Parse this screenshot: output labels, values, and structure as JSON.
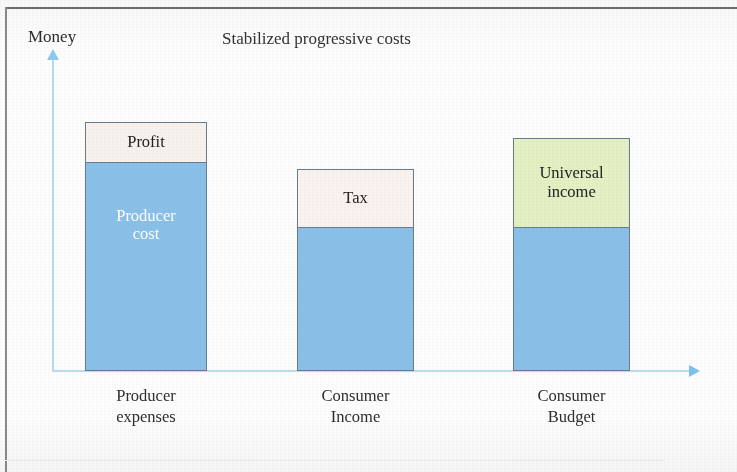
{
  "chart_data": {
    "type": "bar",
    "title": "Stabilized progressive costs",
    "subtitle": "",
    "xlabel": "",
    "ylabel": "Money",
    "stacked": true,
    "grid": false,
    "legend": "none",
    "axis_arrows": true,
    "ylim": [
      0,
      100
    ],
    "categories": [
      "Producer expenses",
      "Consumer Income",
      "Consumer Budget"
    ],
    "series": [
      {
        "name": "Base",
        "values": [
          67,
          46,
          46
        ],
        "labels": [
          "Producer cost",
          "",
          ""
        ],
        "color": "#8ac0e8"
      },
      {
        "name": "Top",
        "values": [
          13,
          19,
          29
        ],
        "labels": [
          "Profit",
          "Tax",
          "Universal income"
        ],
        "colors": [
          "#f7f1ee",
          "#f9f2ef",
          "#e3f0c4"
        ]
      }
    ],
    "bars": [
      {
        "category_line1": "Producer",
        "category_line2": "expenses",
        "top_label": "Profit",
        "top_label_line2": "",
        "base_label_line1": "Producer",
        "base_label_line2": "cost",
        "top_color": "#f7f1ee",
        "base_color": "#8ac0e8",
        "top_text_color": "#222222",
        "base_text_color": "#ffffff",
        "total_height_pct": 80,
        "top_height_pct": 13
      },
      {
        "category_line1": "Consumer",
        "category_line2": "Income",
        "top_label": "Tax",
        "top_label_line2": "",
        "base_label_line1": "",
        "base_label_line2": "",
        "top_color": "#f9f2ef",
        "base_color": "#8ac0e8",
        "top_text_color": "#222222",
        "base_text_color": "#ffffff",
        "total_height_pct": 65,
        "top_height_pct": 19
      },
      {
        "category_line1": "Consumer",
        "category_line2": "Budget",
        "top_label": "Universal",
        "top_label_line2": "income",
        "base_label_line1": "",
        "base_label_line2": "",
        "top_color": "#e3f0c4",
        "base_color": "#8ac0e8",
        "top_text_color": "#222222",
        "base_text_color": "#ffffff",
        "total_height_pct": 75,
        "top_height_pct": 29
      }
    ],
    "colors": {
      "base_blue": "#8ac0e8",
      "profit_cream": "#f7f1ee",
      "tax_cream": "#f9f2ef",
      "universal_green": "#e3f0c4",
      "axis_blue": "#b8dcf2",
      "bar_outline": "#6a7b8c",
      "text": "#2c2c2c"
    }
  }
}
